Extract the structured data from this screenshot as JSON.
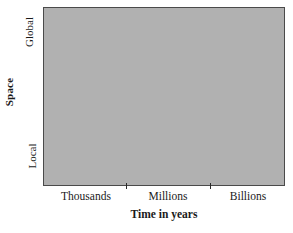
{
  "chart_data": {
    "type": "area",
    "title": "",
    "xlabel": "Time in years",
    "ylabel": "Space",
    "x_tick_labels": [
      "Thousands",
      "Millions",
      "Billions"
    ],
    "y_tick_labels": [
      "Local",
      "Global"
    ],
    "x_tick_count": 2,
    "grid": false,
    "legend": null,
    "annotations": [],
    "series": [
      {
        "name": "Shaded region",
        "description": "Uniform gray filled rectangle spanning the full plot area",
        "fill_color": "#b1b1b1",
        "x_range": [
          "Thousands",
          "Billions"
        ],
        "y_range": [
          "Local",
          "Global"
        ]
      }
    ],
    "plot_fill_color": "#b1b1b1",
    "frame_color": "#4a4a4a",
    "background_color": "#ffffff"
  },
  "axes": {
    "y": {
      "title": "Space",
      "ticks": [
        {
          "label": "Global",
          "position": "top"
        },
        {
          "label": "Local",
          "position": "bottom"
        }
      ]
    },
    "x": {
      "title": "Time in years",
      "ticks": [
        {
          "label": "Thousands"
        },
        {
          "label": "Millions"
        },
        {
          "label": "Billions"
        }
      ]
    }
  }
}
